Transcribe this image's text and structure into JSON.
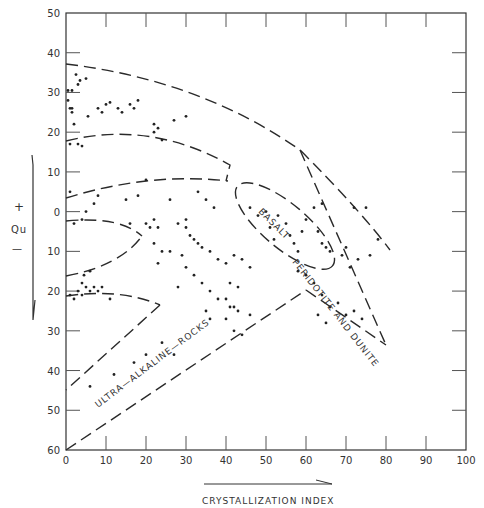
{
  "chart_data": {
    "type": "scatter",
    "title": "",
    "xlabel": "CRYSTALLIZATION INDEX",
    "ylabel": "+ Qu −",
    "xlim": [
      0,
      100
    ],
    "ylim": [
      -60,
      50
    ],
    "x_ticks": [
      0,
      10,
      20,
      30,
      40,
      50,
      60,
      70,
      80,
      90,
      100
    ],
    "y_ticks": [
      50,
      40,
      30,
      20,
      10,
      0,
      -10,
      -20,
      -30,
      -40,
      -50,
      -60
    ],
    "y_tick_labels": [
      "50",
      "40",
      "30",
      "20",
      "10",
      "0",
      "10",
      "20",
      "30",
      "40",
      "50",
      "60"
    ],
    "grid": false,
    "regions": [
      {
        "name": "BASALT",
        "shape": "dashed ellipse",
        "center": [
          55,
          -2
        ],
        "approx": true
      },
      {
        "name": "PERIDOTITE AND DUNITE",
        "shape": "dashed wedge",
        "apex": [
          80,
          -40
        ]
      },
      {
        "name": "ULTRA-ALKALINE-ROCKS",
        "shape": "dashed band",
        "lower_left": [
          0,
          -60
        ]
      }
    ],
    "series": [
      {
        "name": "samples",
        "points": [
          [
            0.5,
            30.5
          ],
          [
            1.5,
            30.5
          ],
          [
            2.5,
            34.5
          ],
          [
            3,
            32
          ],
          [
            3.5,
            33
          ],
          [
            5,
            33.5
          ],
          [
            1,
            26
          ],
          [
            1.5,
            25
          ],
          [
            1.5,
            26
          ],
          [
            0.5,
            28
          ],
          [
            2,
            22
          ],
          [
            5.5,
            24
          ],
          [
            3,
            17
          ],
          [
            1,
            17
          ],
          [
            4,
            16.5
          ],
          [
            8,
            26
          ],
          [
            9,
            25
          ],
          [
            10,
            27
          ],
          [
            11,
            27.5
          ],
          [
            13,
            26
          ],
          [
            14,
            25
          ],
          [
            16,
            27
          ],
          [
            17,
            26
          ],
          [
            18,
            28
          ],
          [
            22,
            22
          ],
          [
            23,
            21
          ],
          [
            22,
            20
          ],
          [
            24,
            18
          ],
          [
            27,
            23
          ],
          [
            30,
            24
          ],
          [
            1,
            5
          ],
          [
            2,
            -3
          ],
          [
            4,
            -2
          ],
          [
            5,
            0
          ],
          [
            7,
            2
          ],
          [
            8,
            4
          ],
          [
            18,
            4
          ],
          [
            20,
            -3
          ],
          [
            22,
            -2
          ],
          [
            23,
            -4
          ],
          [
            26,
            3
          ],
          [
            28,
            -3
          ],
          [
            30,
            -2
          ],
          [
            33,
            5
          ],
          [
            35,
            3
          ],
          [
            37,
            1
          ],
          [
            15,
            3
          ],
          [
            16,
            -3
          ],
          [
            20,
            8
          ],
          [
            21,
            -4
          ],
          [
            4,
            -18
          ],
          [
            4.5,
            -16
          ],
          [
            6,
            -15
          ],
          [
            3,
            -20
          ],
          [
            4,
            -21
          ],
          [
            5,
            -19
          ],
          [
            6,
            -20
          ],
          [
            7,
            -19
          ],
          [
            8,
            -20
          ],
          [
            9,
            -19
          ],
          [
            1,
            -21
          ],
          [
            2,
            -22
          ],
          [
            11,
            -22
          ],
          [
            24,
            -10
          ],
          [
            28,
            -19
          ],
          [
            22,
            -8
          ],
          [
            23,
            -13
          ],
          [
            26,
            -10
          ],
          [
            29,
            -11
          ],
          [
            30,
            -14
          ],
          [
            32,
            -16
          ],
          [
            34,
            -18
          ],
          [
            36,
            -20
          ],
          [
            38,
            -22
          ],
          [
            40,
            -22
          ],
          [
            41,
            -24
          ],
          [
            42,
            -24
          ],
          [
            43,
            -25
          ],
          [
            30,
            -4
          ],
          [
            31,
            -6
          ],
          [
            32,
            -7
          ],
          [
            33,
            -8
          ],
          [
            34,
            -9
          ],
          [
            36,
            -10
          ],
          [
            38,
            -12
          ],
          [
            40,
            -13
          ],
          [
            42,
            -11
          ],
          [
            44,
            -12
          ],
          [
            46,
            -14
          ],
          [
            41,
            -18
          ],
          [
            43,
            -19
          ],
          [
            35,
            -25
          ],
          [
            36,
            -27
          ],
          [
            40,
            -27
          ],
          [
            42,
            -30
          ],
          [
            44,
            -31
          ],
          [
            46,
            -26
          ],
          [
            27,
            -36
          ],
          [
            24,
            -33
          ],
          [
            20,
            -36
          ],
          [
            17,
            -38
          ],
          [
            12,
            -41
          ],
          [
            6,
            -44
          ],
          [
            46,
            1
          ],
          [
            48,
            -1
          ],
          [
            50,
            0
          ],
          [
            51,
            -4
          ],
          [
            52,
            -7
          ],
          [
            53,
            -1
          ],
          [
            55,
            -3
          ],
          [
            56,
            -6
          ],
          [
            57,
            -8
          ],
          [
            58,
            -10
          ],
          [
            60,
            -2
          ],
          [
            59,
            -5
          ],
          [
            62,
            1
          ],
          [
            64,
            2
          ],
          [
            63,
            -5
          ],
          [
            64,
            -8
          ],
          [
            65,
            -9
          ],
          [
            66,
            -10
          ],
          [
            69,
            -11
          ],
          [
            70,
            -9
          ],
          [
            73,
            -12
          ],
          [
            76,
            -11
          ],
          [
            78,
            -7
          ],
          [
            71,
            -14
          ],
          [
            72,
            1
          ],
          [
            75,
            1
          ],
          [
            58,
            -15
          ],
          [
            60,
            -16
          ],
          [
            62,
            -18
          ],
          [
            64,
            -21
          ],
          [
            66,
            -24
          ],
          [
            68,
            -23
          ],
          [
            70,
            -26
          ],
          [
            72,
            -25
          ],
          [
            74,
            -27
          ],
          [
            63,
            -26
          ],
          [
            65,
            -28
          ]
        ]
      }
    ]
  },
  "labels": {
    "basalt": "BASALT",
    "peridotite": "PERIDOTITE AND DUNITE",
    "ultra": "ULTRA—ALKALINE—ROCKS",
    "x_title": "CRYSTALLIZATION INDEX",
    "y_plus": "+",
    "y_qu": "Qu",
    "y_minus": "—"
  },
  "colors": {
    "ink": "#2a2a2a",
    "background": "#ffffff"
  }
}
